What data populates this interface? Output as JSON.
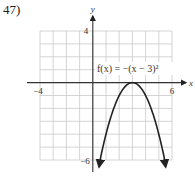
{
  "problem_number": "47)",
  "chart_data": {
    "type": "line",
    "title": "",
    "function_label": "f(x) = −(x − 3)²",
    "function": "-(x-3)^2",
    "xlabel": "x",
    "ylabel": "y",
    "xlim": [
      -4,
      6
    ],
    "ylim": [
      -6,
      4
    ],
    "x_tick_labels": [
      "−4",
      "6"
    ],
    "y_tick_labels": [
      "4",
      "−6"
    ],
    "grid": true,
    "grid_step": 1,
    "vertex": [
      3,
      0
    ],
    "x": [
      0.6,
      1,
      1.5,
      2,
      2.5,
      3,
      3.5,
      4,
      4.5,
      5,
      5.4
    ],
    "y": [
      -5.76,
      -4,
      -2.25,
      -1,
      -0.25,
      0,
      -0.25,
      -1,
      -2.25,
      -4,
      -5.76
    ],
    "arrows_at_ends": true,
    "curve_color": "#222222",
    "grid_color": "#c9c9c9"
  }
}
